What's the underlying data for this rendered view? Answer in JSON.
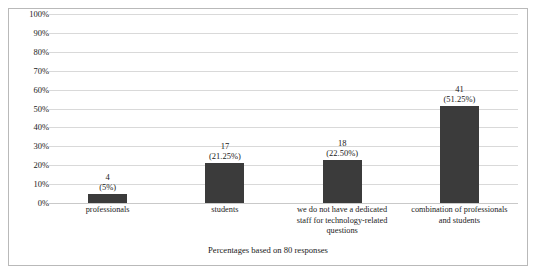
{
  "figure": {
    "caption": "Percentages based on 80 responses",
    "bar_color": "#3b3b3b",
    "gridline_color": "#d9d9d9",
    "border_color": "#b9b9b9"
  },
  "chart_data": {
    "type": "bar",
    "title": "",
    "xlabel": "",
    "ylabel": "",
    "ylim": [
      0,
      100
    ],
    "grid": true,
    "legend": "none",
    "ytick_labels": [
      "100%",
      "90%",
      "80%",
      "70%",
      "60%",
      "50%",
      "40%",
      "30%",
      "20%",
      "10%",
      "0%"
    ],
    "ytick_values": [
      100,
      90,
      80,
      70,
      60,
      50,
      40,
      30,
      20,
      10,
      0
    ],
    "categories": [
      "professionals",
      "students",
      "we do not have a dedicated staff for technology-related questions",
      "combination of professionals and students"
    ],
    "category_lines": [
      [
        "professionals"
      ],
      [
        "students"
      ],
      [
        "we do not have a dedicated",
        "staff for technology-related",
        "questions"
      ],
      [
        "combination of professionals",
        "and students"
      ]
    ],
    "counts": [
      4,
      17,
      18,
      41
    ],
    "values": [
      5,
      21.25,
      22.5,
      51.25
    ],
    "data_labels": [
      {
        "count": "4",
        "pct": "(5%)"
      },
      {
        "count": "17",
        "pct": "(21.25%)"
      },
      {
        "count": "18",
        "pct": "(22.50%)"
      },
      {
        "count": "41",
        "pct": "(51.25%)"
      }
    ],
    "total_responses": 80
  }
}
